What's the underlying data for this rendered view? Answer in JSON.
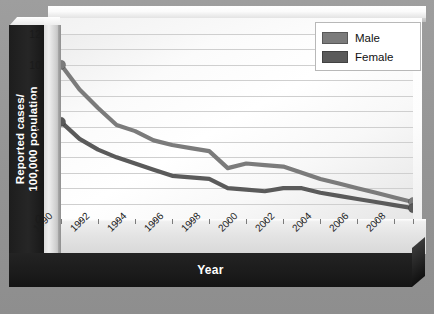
{
  "axes": {
    "y_title": "Reported cases/\n100,000 population",
    "x_title": "Year"
  },
  "legend": {
    "items": [
      {
        "label": "Male",
        "color": "#7b7b7b"
      },
      {
        "label": "Female",
        "color": "#5a5a5a"
      }
    ]
  },
  "chart_data": {
    "type": "line",
    "title": "",
    "xlabel": "Year",
    "ylabel": "Reported cases/ 100,000 population",
    "xlim": [
      1990,
      2009
    ],
    "ylim": [
      0,
      12
    ],
    "yticks": [
      0,
      2,
      4,
      6,
      8,
      10,
      12
    ],
    "ytick_labels": [
      "0",
      "2",
      "4",
      "6",
      "8",
      "10",
      "12"
    ],
    "xticks": [
      1990,
      1991,
      1992,
      1993,
      1994,
      1995,
      1996,
      1997,
      1998,
      1999,
      2000,
      2001,
      2002,
      2003,
      2004,
      2005,
      2006,
      2007,
      2008,
      2009
    ],
    "xtick_labels": [
      "1990",
      "",
      "1992",
      "",
      "1994",
      "",
      "1996",
      "",
      "1998",
      "",
      "2000",
      "",
      "2002",
      "",
      "2004",
      "",
      "2006",
      "",
      "2008",
      ""
    ],
    "grid": true,
    "grid_axis": "y",
    "grid_step": 1,
    "legend_position": "top-right",
    "x": [
      1990,
      1991,
      1992,
      1993,
      1994,
      1995,
      1996,
      1997,
      1998,
      1999,
      2000,
      2001,
      2002,
      2003,
      2004,
      2005,
      2006,
      2007,
      2008,
      2009
    ],
    "series": [
      {
        "name": "Male",
        "color": "#7b7b7b",
        "marker_endpoints": true,
        "values": [
          10.0,
          8.4,
          7.2,
          6.1,
          5.7,
          5.1,
          4.8,
          4.6,
          4.4,
          3.3,
          3.6,
          3.5,
          3.4,
          3.0,
          2.6,
          2.3,
          2.0,
          1.7,
          1.4,
          1.1
        ]
      },
      {
        "name": "Female",
        "color": "#5a5a5a",
        "marker_endpoints": true,
        "values": [
          6.3,
          5.2,
          4.5,
          4.0,
          3.6,
          3.2,
          2.8,
          2.7,
          2.6,
          2.0,
          1.9,
          1.8,
          2.0,
          2.0,
          1.7,
          1.5,
          1.3,
          1.1,
          0.9,
          0.7
        ]
      }
    ]
  }
}
